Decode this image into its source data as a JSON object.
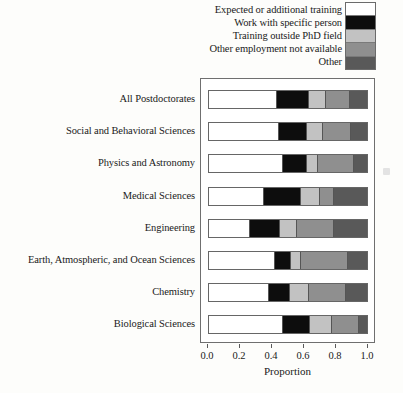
{
  "chart_data": {
    "type": "bar",
    "orientation": "horizontal",
    "stacked": true,
    "normalized": true,
    "title": "",
    "xlabel": "Proportion",
    "ylabel": "",
    "xlim": [
      0.0,
      1.0
    ],
    "grid": false,
    "legend_position": "top-right",
    "xtick_labels": [
      "0.0",
      "0.2",
      "0.4",
      "0.6",
      "0.8",
      "1.0"
    ],
    "xtick_values": [
      0.0,
      0.2,
      0.4,
      0.6,
      0.8,
      1.0
    ],
    "categories": [
      "All Postdoctorates",
      "Social and Behavioral Sciences",
      "Physics and Astronomy",
      "Medical Sciences",
      "Engineering",
      "Earth, Atmospheric, and Ocean Sciences",
      "Chemistry",
      "Biological Sciences"
    ],
    "series": [
      {
        "name": "Expected or additional training",
        "color": "#ffffff",
        "values": [
          0.43,
          0.44,
          0.47,
          0.35,
          0.26,
          0.42,
          0.38,
          0.47
        ]
      },
      {
        "name": "Work with specific person",
        "color": "#0d0d0d",
        "values": [
          0.2,
          0.18,
          0.15,
          0.23,
          0.19,
          0.1,
          0.13,
          0.17
        ]
      },
      {
        "name": "Training outside PhD field",
        "color": "#c2c2c2",
        "values": [
          0.11,
          0.1,
          0.07,
          0.12,
          0.11,
          0.06,
          0.12,
          0.14
        ]
      },
      {
        "name": "Other employment not available",
        "color": "#8f8f8f",
        "values": [
          0.15,
          0.18,
          0.23,
          0.09,
          0.23,
          0.3,
          0.24,
          0.17
        ]
      },
      {
        "name": "Other",
        "color": "#595959",
        "values": [
          0.11,
          0.1,
          0.08,
          0.21,
          0.21,
          0.12,
          0.13,
          0.05
        ]
      }
    ]
  }
}
